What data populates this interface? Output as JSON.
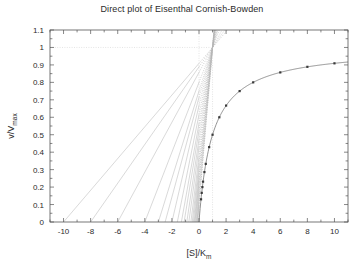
{
  "chart_data": {
    "type": "line",
    "title": "Direct plot of Eisenthal Cornish-Bowden",
    "xlabel_main": "[S]/K",
    "xlabel_sub": "m",
    "ylabel_main": "v/V",
    "ylabel_sub": "max",
    "xlim": [
      -11,
      11
    ],
    "ylim": [
      0,
      1.1
    ],
    "grid": false,
    "legend": "none",
    "xticks": [
      -10,
      -8,
      -6,
      -4,
      -2,
      0,
      2,
      4,
      6,
      8,
      10
    ],
    "xtick_labels": [
      "-10",
      "-8",
      "-6",
      "-4",
      "-2",
      "0",
      "2",
      "4",
      "6",
      "8",
      "10"
    ],
    "yticks": [
      0,
      0.1,
      0.2,
      0.3,
      0.4,
      0.5,
      0.6,
      0.7,
      0.8,
      0.9,
      1,
      1.1
    ],
    "ytick_labels": [
      "0",
      "0.1",
      "0.2",
      "0.3",
      "0.4",
      "0.5",
      "0.6",
      "0.7",
      "0.8",
      "0.9",
      "1",
      "1.1"
    ],
    "xminor_step": 1,
    "yminor_step": 0.05,
    "convergence_point": [
      1,
      1
    ],
    "series": [
      {
        "name": "Michaelis-Menten curve",
        "type": "line",
        "equation": "v/Vmax = S/(1+S)",
        "x": [
          0,
          0.1,
          0.2,
          0.3,
          0.4,
          0.5,
          0.75,
          1,
          1.25,
          1.5,
          2,
          2.5,
          3,
          4,
          5,
          6,
          7,
          8,
          9,
          10,
          11
        ],
        "y": [
          0,
          0.091,
          0.167,
          0.231,
          0.286,
          0.333,
          0.429,
          0.5,
          0.556,
          0.6,
          0.667,
          0.714,
          0.75,
          0.8,
          0.833,
          0.857,
          0.875,
          0.889,
          0.9,
          0.909,
          0.917
        ]
      },
      {
        "name": "Observed data points",
        "type": "scatter",
        "x": [
          0.15,
          0.2,
          0.25,
          0.3,
          0.4,
          0.5,
          0.75,
          1,
          1.5,
          2,
          3,
          4,
          6,
          8,
          10
        ],
        "y": [
          0.13,
          0.167,
          0.2,
          0.231,
          0.286,
          0.333,
          0.429,
          0.5,
          0.6,
          0.667,
          0.75,
          0.8,
          0.857,
          0.889,
          0.909
        ]
      },
      {
        "name": "Direct linear plot lines",
        "type": "line",
        "description": "Each line joins x = -[S]/Km on the abscissa to y = v/Vmax on the ordinate, intersecting near (1, 1)",
        "x_intercepts": [
          -10,
          -8,
          -6,
          -4,
          -3,
          -2.5,
          -2,
          -1.6,
          -1.3,
          -1.1,
          -0.9,
          -0.75,
          -0.6,
          -0.5,
          -0.42,
          -0.35,
          -0.3,
          -0.25,
          -0.2,
          -0.15,
          -0.12,
          -0.1
        ],
        "y_intercepts": [
          0.909,
          0.889,
          0.857,
          0.8,
          0.75,
          0.714,
          0.667,
          0.615,
          0.565,
          0.524,
          0.474,
          0.429,
          0.375,
          0.333,
          0.296,
          0.259,
          0.231,
          0.2,
          0.167,
          0.13,
          0.107,
          0.091
        ]
      }
    ]
  }
}
